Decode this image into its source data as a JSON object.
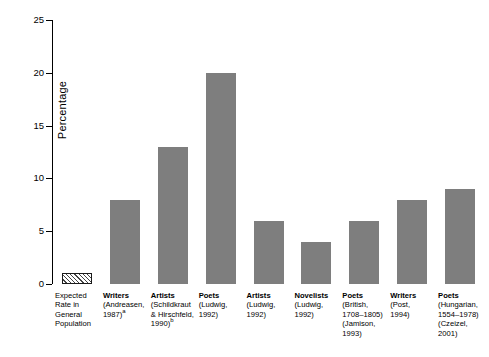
{
  "chart_data": {
    "type": "bar",
    "title": "",
    "xlabel": "",
    "ylabel": "Percentage",
    "ylim": [
      0,
      25
    ],
    "yticks": [
      0,
      5,
      10,
      15,
      20,
      25
    ],
    "grid": false,
    "legend": false,
    "categories": [
      "Expected Rate in General Population",
      "Writers (Andreasen, 1987)a",
      "Artists (Schildkraut & Hirschfeld, 1990)b",
      "Poets (Ludwig, 1992)",
      "Artists (Ludwig, 1992)",
      "Novelists (Ludwig, 1992)",
      "Poets (British, 1708–1805) (Jamison, 1993)",
      "Writers (Post, 1994)",
      "Poets (Hungarian, 1554–1978) (Czeizel, 2001)"
    ],
    "values": [
      1,
      8,
      13,
      20,
      6,
      4,
      6,
      8,
      9
    ],
    "bar_styles": [
      "hatched",
      "solid",
      "solid",
      "solid",
      "solid",
      "solid",
      "solid",
      "solid",
      "solid"
    ],
    "bar_color": "#7e7e7e",
    "hatch_color": "#444444"
  },
  "axis": {
    "ylabel": "Percentage",
    "ytick_labels": [
      "0",
      "5",
      "10",
      "15",
      "20",
      "25"
    ]
  },
  "xlabels": [
    {
      "head": "Expected",
      "bold": false,
      "lines": [
        "Rate in",
        "General",
        "Population"
      ],
      "sup": ""
    },
    {
      "head": "Writers",
      "bold": true,
      "lines": [
        "(Andreasen,",
        "1987)"
      ],
      "sup": "a"
    },
    {
      "head": "Artists",
      "bold": true,
      "lines": [
        "(Schildkraut",
        "& Hirschfeld,",
        "1990)"
      ],
      "sup": "b"
    },
    {
      "head": "Poets",
      "bold": true,
      "lines": [
        "(Ludwig,",
        "1992)"
      ],
      "sup": ""
    },
    {
      "head": "Artists",
      "bold": true,
      "lines": [
        "(Ludwig,",
        "1992)"
      ],
      "sup": ""
    },
    {
      "head": "Novelists",
      "bold": true,
      "lines": [
        "(Ludwig,",
        "1992)"
      ],
      "sup": ""
    },
    {
      "head": "Poets",
      "bold": true,
      "lines": [
        "(British,",
        "1708–1805)",
        "(Jamison,",
        "1993)"
      ],
      "sup": ""
    },
    {
      "head": "Writers",
      "bold": true,
      "lines": [
        "(Post,",
        "1994)"
      ],
      "sup": ""
    },
    {
      "head": "Poets",
      "bold": true,
      "lines": [
        "(Hungarian,",
        "1554–1978)",
        "(Czeizel,",
        "2001)"
      ],
      "sup": ""
    }
  ]
}
